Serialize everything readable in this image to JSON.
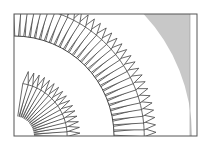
{
  "figure": {
    "frame": {
      "x": 14,
      "y": 14,
      "width": 183,
      "height": 122,
      "stroke": "#555555"
    },
    "center": {
      "x": 14,
      "y": 136
    },
    "outer_ring": {
      "inner_radius": 100,
      "tip_radius": 142,
      "teeth": 30,
      "start_deg": 0,
      "end_deg": 90
    },
    "inner_fan": {
      "inner_radius": 20,
      "tip_radius": 66,
      "teeth": 16,
      "start_deg": 0,
      "end_deg": 80
    },
    "shaded_band": {
      "radius": 178,
      "fill": "#c8c8c8",
      "right_x": 190
    },
    "colors": {
      "line": "#444444",
      "paper": "#ffffff",
      "shade": "#c8c8c8"
    }
  }
}
